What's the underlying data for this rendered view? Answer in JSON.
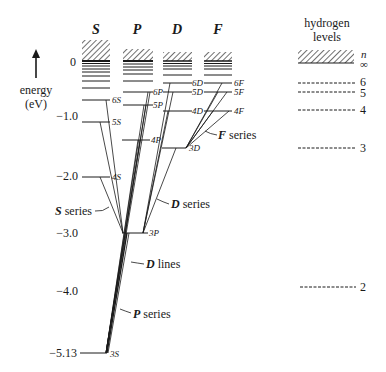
{
  "title": "",
  "axis": {
    "label_line1": "energy",
    "label_line2": "(eV)",
    "ticks": [
      {
        "label": "0",
        "y": 62
      },
      {
        "label": "−1.0",
        "y": 116
      },
      {
        "label": "−2.0",
        "y": 176
      },
      {
        "label": "−3.0",
        "y": 233
      },
      {
        "label": "−4.0",
        "y": 291
      },
      {
        "label": "−5.13",
        "y": 353
      }
    ]
  },
  "columns": [
    {
      "key": "S",
      "label": "S",
      "x1": 82,
      "x2": 110
    },
    {
      "key": "P",
      "label": "P",
      "x1": 122,
      "x2": 152
    },
    {
      "key": "D",
      "label": "D",
      "x1": 162,
      "x2": 192
    },
    {
      "key": "F",
      "label": "F",
      "x1": 203,
      "x2": 232
    }
  ],
  "levels": {
    "S": [
      {
        "label": "6S",
        "y": 100
      },
      {
        "label": "5S",
        "y": 122
      },
      {
        "label": "4S",
        "y": 177
      },
      {
        "label": "3S",
        "y": 353
      }
    ],
    "P": [
      {
        "label": "6P",
        "y": 92
      },
      {
        "label": "5P",
        "y": 105
      },
      {
        "label": "4P",
        "y": 140
      },
      {
        "label": "3P",
        "y": 233
      }
    ],
    "D": [
      {
        "label": "6D",
        "y": 83
      },
      {
        "label": "5D",
        "y": 92
      },
      {
        "label": "4D",
        "y": 111
      },
      {
        "label": "3D",
        "y": 148
      }
    ],
    "F": [
      {
        "label": "6F",
        "y": 83
      },
      {
        "label": "5F",
        "y": 92
      },
      {
        "label": "4F",
        "y": 111
      }
    ]
  },
  "annotations": {
    "s_series": "S series",
    "p_series": "P series",
    "d_series": "D series",
    "f_series": "F series",
    "d_lines": "D lines"
  },
  "hydrogen": {
    "title_line1": "hydrogen",
    "title_line2": "levels",
    "n_label": "n",
    "inf_label": "∞",
    "levels": [
      {
        "n": "6",
        "y": 83
      },
      {
        "n": "5",
        "y": 92
      },
      {
        "n": "4",
        "y": 110
      },
      {
        "n": "3",
        "y": 148
      },
      {
        "n": "2",
        "y": 287
      }
    ]
  },
  "colors": {
    "ink": "#1a1a1a",
    "background": "#ffffff"
  }
}
